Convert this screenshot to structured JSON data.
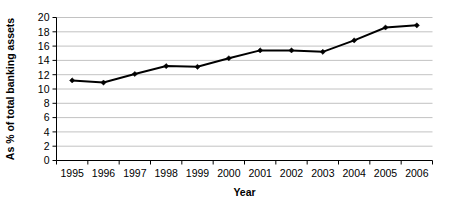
{
  "chart_data": {
    "type": "line",
    "title": "",
    "xlabel": "Year",
    "ylabel": "As % of total banking assets",
    "categories": [
      "1995",
      "1996",
      "1997",
      "1998",
      "1999",
      "2000",
      "2001",
      "2002",
      "2003",
      "2004",
      "2005",
      "2006"
    ],
    "values": [
      11.2,
      10.9,
      12.1,
      13.2,
      13.1,
      14.3,
      15.4,
      15.4,
      15.2,
      16.8,
      18.6,
      18.9
    ],
    "series": [
      {
        "name": "As % of total banking assets",
        "values": [
          11.2,
          10.9,
          12.1,
          13.2,
          13.1,
          14.3,
          15.4,
          15.4,
          15.2,
          16.8,
          18.6,
          18.9
        ]
      }
    ],
    "ylim": [
      0,
      20
    ],
    "ytick_values": [
      0,
      2,
      4,
      6,
      8,
      10,
      12,
      14,
      16,
      18,
      20
    ],
    "ytick_labels": [
      "0",
      "2",
      "4",
      "6",
      "8",
      "10",
      "12",
      "14",
      "16",
      "18",
      "20"
    ],
    "grid": true,
    "grid_axis": "y",
    "legend": false,
    "legend_position": "none",
    "marker": "diamond",
    "line_color": "#000000",
    "grid_color": "#b3b3b3",
    "axis_color": "#000000",
    "background_color": "#ffffff"
  }
}
